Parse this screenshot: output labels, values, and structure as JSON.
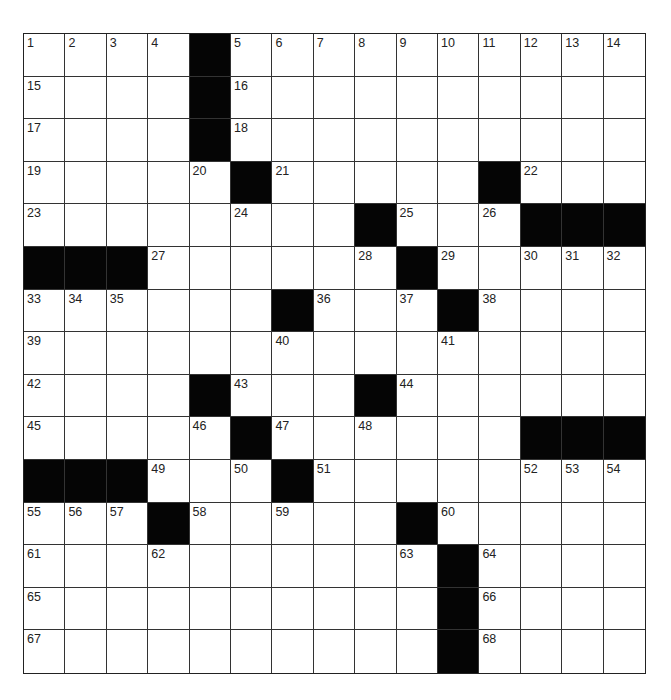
{
  "puzzle": {
    "rows": 15,
    "cols": 15,
    "block_color": "#050505",
    "cell_color": "#ffffff",
    "line_color": "#333333",
    "grid": [
      "1,2,3,4,#,5,6,7,8,9,10,11,12,13,14",
      "15,.,.,.,#,16,.,.,.,.,.,.,.,.,.",
      "17,.,.,.,#,18,.,.,.,.,.,.,.,.,.",
      "19,.,.,.,20,#,21,.,.,.,.,#,22,.,.",
      "23,.,.,.,.,24,.,.,#,25,.,26,#,#,#",
      "#,#,#,27,.,.,.,.,28,#,29,.,30,31,32",
      "33,34,35,.,.,.,#,36,.,37,#,38,.,.,.",
      "39,.,.,.,.,.,40,.,.,.,41,.,.,.,.",
      "42,.,.,.,#,43,.,.,#,44,.,.,.,.,.",
      "45,.,.,.,46,#,47,.,48,.,.,.,#,#,#",
      "#,#,#,49,.,50,#,51,.,.,.,.,52,53,54",
      "55,56,57,#,58,.,59,.,.,#,60,.,.,.,.",
      "61,.,.,62,.,.,.,.,.,63,#,64,.,.,.",
      "65,.,.,.,.,.,.,.,.,.,#,66,.,.,.",
      "67,.,.,.,.,.,.,.,.,.,#,68,.,.,."
    ]
  }
}
